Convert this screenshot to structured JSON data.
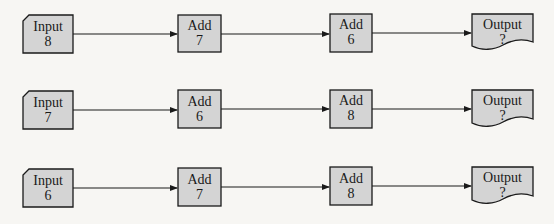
{
  "colors": {
    "box_fill": "#d4d4d4",
    "stroke": "#1a1a1a",
    "background": "#f7f6f3"
  },
  "rows": [
    {
      "input": {
        "title": "Input",
        "value": "8"
      },
      "step1": {
        "title": "Add",
        "value": "7"
      },
      "step2": {
        "title": "Add",
        "value": "6"
      },
      "output": {
        "title": "Output",
        "value": "?"
      }
    },
    {
      "input": {
        "title": "Input",
        "value": "7"
      },
      "step1": {
        "title": "Add",
        "value": "6"
      },
      "step2": {
        "title": "Add",
        "value": "8"
      },
      "output": {
        "title": "Output",
        "value": "?"
      }
    },
    {
      "input": {
        "title": "Input",
        "value": "6"
      },
      "step1": {
        "title": "Add",
        "value": "7"
      },
      "step2": {
        "title": "Add",
        "value": "8"
      },
      "output": {
        "title": "Output",
        "value": "?"
      }
    }
  ]
}
